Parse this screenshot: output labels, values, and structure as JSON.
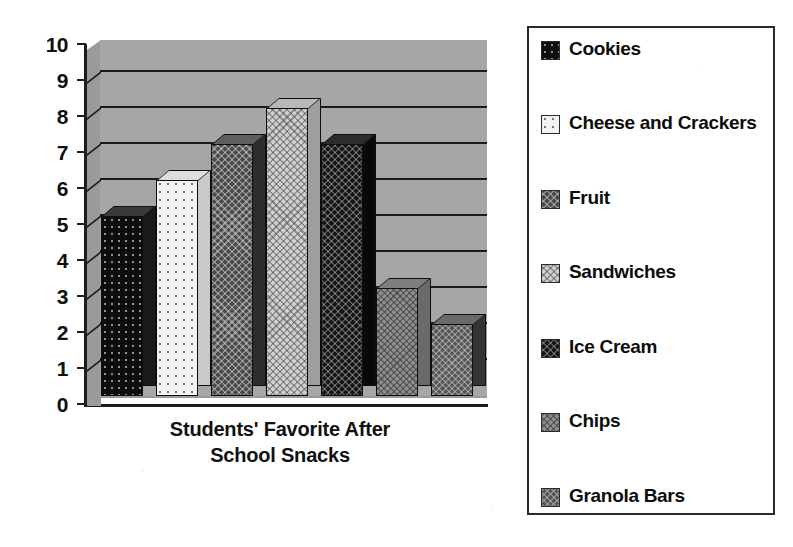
{
  "chart_data": {
    "type": "bar",
    "title": "Students' Favorite After School Snacks",
    "title_line1": "Students' Favorite After",
    "title_line2": "School Snacks",
    "xlabel": "Students' Favorite After School Snacks",
    "ylabel": "",
    "categories": [
      "Cookies",
      "Cheese and Crackers",
      "Fruit",
      "Sandwiches",
      "Ice Cream",
      "Chips",
      "Granola Bars"
    ],
    "values": [
      5,
      6,
      7,
      8,
      7,
      3,
      2
    ],
    "ylim": [
      0,
      10
    ],
    "ytick_labels": [
      "10",
      "9",
      "8",
      "7",
      "6",
      "5",
      "4",
      "3",
      "2",
      "1",
      "0"
    ],
    "grid": true,
    "legend_position": "right",
    "style": "3d-column",
    "bar_colors": [
      "#0d0d0d",
      "#f2f2f0",
      "#4a4a4a",
      "#cfcfcf",
      "#161616",
      "#8e8e8e",
      "#565656"
    ],
    "plot_background": "#a6a6a6",
    "page_background": "#ffffff"
  },
  "legend": {
    "items": [
      {
        "label": "Cookies",
        "pattern": "p-black"
      },
      {
        "label": "Cheese and Crackers",
        "pattern": "p-white"
      },
      {
        "label": "Fruit",
        "pattern": "p-dkgray"
      },
      {
        "label": "Sandwiches",
        "pattern": "p-ltgray"
      },
      {
        "label": "Ice Cream",
        "pattern": "p-verydark"
      },
      {
        "label": "Chips",
        "pattern": "p-mdgray"
      },
      {
        "label": "Granola Bars",
        "pattern": "p-dkgray2"
      }
    ]
  }
}
